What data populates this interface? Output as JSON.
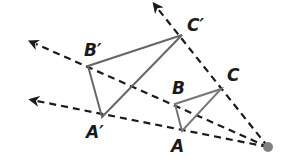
{
  "diagram": {
    "type": "dilation",
    "center": {
      "name": "center-of-dilation",
      "x": 268,
      "y": 147,
      "color": "#808080"
    },
    "original_triangle": {
      "color": "#777777",
      "vertices": [
        {
          "label": "A",
          "x": 182,
          "y": 131
        },
        {
          "label": "B",
          "x": 175,
          "y": 104
        },
        {
          "label": "C",
          "x": 221,
          "y": 89
        }
      ]
    },
    "image_triangle": {
      "color": "#666666",
      "vertices": [
        {
          "label": "A′",
          "x": 102,
          "y": 117
        },
        {
          "label": "B′",
          "x": 88,
          "y": 66
        },
        {
          "label": "C′",
          "x": 182,
          "y": 35
        }
      ]
    },
    "rays": [
      {
        "name": "ray-through-B",
        "tip_x": 32,
        "tip_y": 42
      },
      {
        "name": "ray-through-A",
        "tip_x": 33,
        "tip_y": 101
      },
      {
        "name": "ray-through-C",
        "tip_x": 155,
        "tip_y": 5
      }
    ],
    "ray_color": "#1a1a1a",
    "labels": {
      "A": "A",
      "B": "B",
      "C": "C",
      "A_prime": "A′",
      "B_prime": "B′",
      "C_prime": "C′"
    }
  }
}
